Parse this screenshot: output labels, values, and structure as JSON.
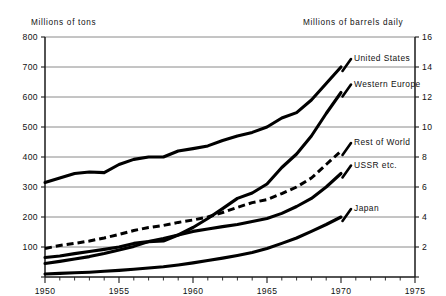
{
  "chart_data": {
    "type": "line",
    "title": "",
    "subtitle": "",
    "ylabel": "Millions of tons",
    "ylabel_right": "Millions of barrels daily",
    "xlabel": "",
    "xlim": [
      1950,
      1975
    ],
    "ylim": [
      0,
      800
    ],
    "ylim_right": [
      0,
      16
    ],
    "grid": true,
    "legend_position": "inline-right-of-lines",
    "xticks": [
      1950,
      1955,
      1960,
      1965,
      1970,
      1975
    ],
    "xticklabels": [
      "1950",
      "1955",
      "1960",
      "1965",
      "1970",
      "1975"
    ],
    "xminorticks_interval": 1,
    "yticks": [
      0,
      100,
      200,
      300,
      400,
      500,
      600,
      700,
      800
    ],
    "yticklabels": [
      "",
      "100",
      "200",
      "300",
      "400",
      "500",
      "600",
      "700",
      "800"
    ],
    "yticks_right": [
      0,
      2,
      4,
      6,
      8,
      10,
      12,
      14,
      16
    ],
    "yticklabels_right": [
      "",
      "2",
      "4",
      "6",
      "8",
      "10",
      "12",
      "14",
      "16"
    ],
    "x": [
      1950,
      1951,
      1952,
      1953,
      1954,
      1955,
      1956,
      1957,
      1958,
      1959,
      1960,
      1961,
      1962,
      1963,
      1964,
      1965,
      1966,
      1967,
      1968,
      1969,
      1970
    ],
    "series": [
      {
        "name": "United States",
        "style": "solid",
        "color": "#000000",
        "values": [
          315,
          330,
          345,
          350,
          348,
          375,
          392,
          400,
          400,
          420,
          428,
          437,
          455,
          470,
          482,
          500,
          530,
          548,
          590,
          645,
          700
        ]
      },
      {
        "name": "Western Europe",
        "style": "solid",
        "color": "#000000",
        "values": [
          45,
          52,
          60,
          68,
          78,
          90,
          102,
          118,
          120,
          140,
          165,
          195,
          228,
          262,
          280,
          310,
          365,
          410,
          470,
          545,
          615
        ]
      },
      {
        "name": "Rest of World",
        "style": "dashed",
        "color": "#000000",
        "values": [
          95,
          105,
          112,
          120,
          130,
          142,
          155,
          165,
          172,
          182,
          190,
          200,
          215,
          232,
          248,
          258,
          278,
          300,
          330,
          375,
          420
        ]
      },
      {
        "name": "USSR etc.",
        "style": "solid",
        "color": "#000000",
        "values": [
          65,
          70,
          78,
          85,
          92,
          100,
          112,
          118,
          128,
          140,
          152,
          160,
          168,
          175,
          185,
          195,
          212,
          235,
          262,
          300,
          345
        ]
      },
      {
        "name": "Japan",
        "style": "solid",
        "color": "#000000",
        "values": [
          10,
          12,
          14,
          16,
          19,
          22,
          26,
          30,
          34,
          40,
          47,
          55,
          63,
          72,
          82,
          95,
          112,
          130,
          152,
          175,
          200
        ]
      }
    ],
    "annotations": [
      {
        "text": "United States",
        "x": 1970,
        "y": 700
      },
      {
        "text": "Western Europe",
        "x": 1970,
        "y": 615
      },
      {
        "text": "Rest of World",
        "x": 1970,
        "y": 420
      },
      {
        "text": "USSR etc.",
        "x": 1970,
        "y": 345
      },
      {
        "text": "Japan",
        "x": 1970,
        "y": 200
      }
    ]
  }
}
